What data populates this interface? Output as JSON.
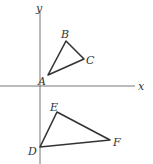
{
  "figure": {
    "axes": {
      "x_label": "x",
      "y_label": "y",
      "origin": [
        40,
        86
      ],
      "x_axis": {
        "from": [
          0,
          86
        ],
        "to": [
          135,
          86
        ]
      },
      "y_axis": {
        "from": [
          40,
          12
        ],
        "to": [
          40,
          164
        ]
      }
    },
    "triangles": [
      {
        "name": "ABC",
        "vertices": [
          {
            "label": "A",
            "x": 48,
            "y": 75,
            "lx": 38,
            "ly": 85
          },
          {
            "label": "B",
            "x": 66,
            "y": 41,
            "lx": 61,
            "ly": 38
          },
          {
            "label": "C",
            "x": 84,
            "y": 59,
            "lx": 86,
            "ly": 64
          }
        ]
      },
      {
        "name": "DEF",
        "vertices": [
          {
            "label": "D",
            "x": 40,
            "y": 147,
            "lx": 28,
            "ly": 155
          },
          {
            "label": "E",
            "x": 57,
            "y": 112,
            "lx": 50,
            "ly": 111
          },
          {
            "label": "F",
            "x": 110,
            "y": 140,
            "lx": 113,
            "ly": 146
          }
        ]
      }
    ],
    "colors": {
      "axis": "#666666",
      "triangle": "#333333",
      "label": "#333333"
    }
  }
}
